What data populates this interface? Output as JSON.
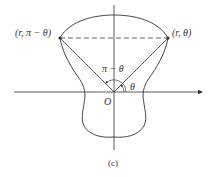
{
  "diagram": {
    "labels": {
      "left_point": "(r, π − θ)",
      "right_point": "(r, θ)",
      "angle_complement": "π − θ",
      "angle": "θ",
      "origin": "O",
      "caption": "(c)"
    },
    "colors": {
      "stroke": "#333333",
      "background": "#ffffff"
    }
  }
}
